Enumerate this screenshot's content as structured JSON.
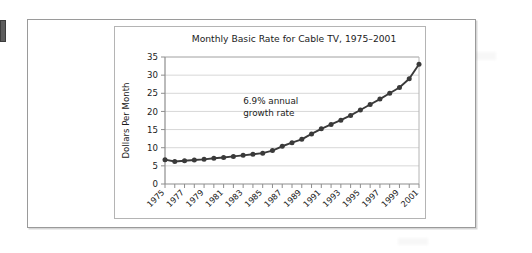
{
  "figure": {
    "edge_tab_name": "page-edge-marker"
  },
  "chart_data": {
    "type": "line",
    "title": "Monthly Basic Rate for Cable TV, 1975–2001",
    "xlabel": "",
    "ylabel": "Dollars Per Month",
    "ylim": [
      0,
      35
    ],
    "yticks": [
      0,
      5,
      10,
      15,
      20,
      25,
      30,
      35
    ],
    "ytick_labels": [
      "0",
      "5",
      "10",
      "15",
      "20",
      "25",
      "30",
      "35"
    ],
    "xlim": [
      1975,
      2001
    ],
    "grid": "horizontal",
    "legend": "none",
    "annotations": [
      {
        "text_line_1": "6.9% annual",
        "text_line_2": "growth rate",
        "x": 1983,
        "y": 22
      }
    ],
    "x": [
      1975,
      1976,
      1977,
      1978,
      1979,
      1980,
      1981,
      1982,
      1983,
      1984,
      1985,
      1986,
      1987,
      1988,
      1989,
      1990,
      1991,
      1992,
      1993,
      1994,
      1995,
      1996,
      1997,
      1998,
      1999,
      2000,
      2001
    ],
    "xtick_labels": [
      "1975",
      "1977",
      "1979",
      "1981",
      "1983",
      "1985",
      "1987",
      "1989",
      "1991",
      "1993",
      "1995",
      "1997",
      "1999",
      "2001"
    ],
    "xtick_values": [
      1975,
      1977,
      1979,
      1981,
      1983,
      1985,
      1987,
      1989,
      1991,
      1993,
      1995,
      1997,
      1999,
      2001
    ],
    "values": [
      6.7,
      6.2,
      6.4,
      6.6,
      6.8,
      7.1,
      7.3,
      7.6,
      7.9,
      8.2,
      8.5,
      9.2,
      10.4,
      11.4,
      12.3,
      13.8,
      15.2,
      16.4,
      17.6,
      18.9,
      20.4,
      21.9,
      23.4,
      25.0,
      26.6,
      29.0,
      33.0
    ],
    "series_color": "#3a3a3a",
    "marker": "circle"
  }
}
